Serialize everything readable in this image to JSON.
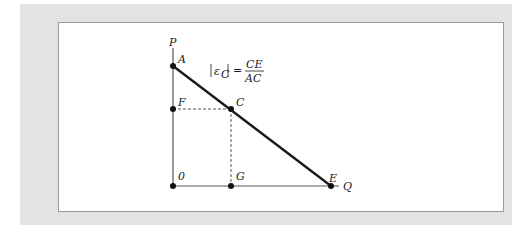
{
  "figure": {
    "type": "linear demand curve elasticity diagram",
    "axes": {
      "y_label": "P",
      "x_label": "Q",
      "origin_label": "0"
    },
    "points": [
      {
        "label": "A",
        "description": "vertical intercept of demand line"
      },
      {
        "label": "F",
        "description": "price level of point C on vertical axis"
      },
      {
        "label": "C",
        "description": "point on demand line"
      },
      {
        "label": "G",
        "description": "quantity of point C on horizontal axis"
      },
      {
        "label": "E",
        "description": "horizontal intercept of demand line"
      }
    ],
    "formula": {
      "lhs": "|ε",
      "lhs_sub": "C",
      "lhs_close": "|",
      "equals": "=",
      "numerator": "CE",
      "denominator": "AC"
    },
    "colors": {
      "panel_bg": "#e3e3e3",
      "figure_bg": "#ffffff",
      "line": "#1a1a1a",
      "axis": "#555555"
    }
  }
}
